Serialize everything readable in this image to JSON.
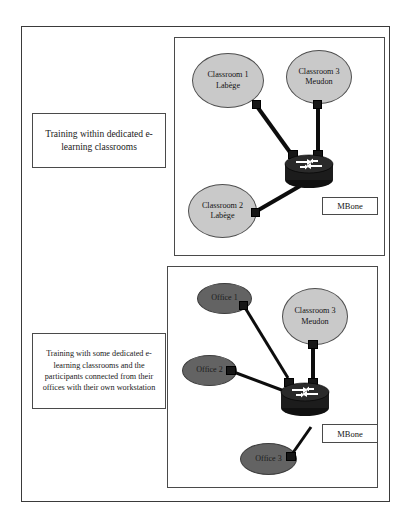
{
  "figure": {
    "panels": [
      {
        "id": "dedicated-classrooms",
        "caption": "Training within dedicated e-learning classrooms",
        "nodes": [
          {
            "name": "classroom-1",
            "type": "classroom",
            "line1": "Classroom 1",
            "line2": "Labège"
          },
          {
            "name": "classroom-3",
            "type": "classroom",
            "line1": "Classroom 3",
            "line2": "Meudon"
          },
          {
            "name": "classroom-2",
            "type": "classroom",
            "line1": "Classroom 2",
            "line2": "Labège"
          }
        ],
        "router_label": "MBone"
      },
      {
        "id": "mixed-classrooms-offices",
        "caption": "Training with some dedicated e-learning classrooms and the participants connected from their offices with their own workstation",
        "nodes": [
          {
            "name": "office-1",
            "type": "office",
            "line1": "Office 1",
            "line2": ""
          },
          {
            "name": "classroom-3",
            "type": "classroom",
            "line1": "Classroom 3",
            "line2": "Meudon"
          },
          {
            "name": "office-2",
            "type": "office",
            "line1": "Office 2",
            "line2": ""
          },
          {
            "name": "office-3",
            "type": "office",
            "line1": "Office 3",
            "line2": ""
          }
        ],
        "router_label": "MBone"
      }
    ],
    "colors": {
      "classroom_fill": "#c9c9c9",
      "office_fill": "#636363",
      "router_body": "#1c1c1c",
      "link": "#0d0d0d",
      "border": "#4a4a4a",
      "background": "#ffffff"
    },
    "icons": {
      "router": "router-icon",
      "connector": "connector-square-icon"
    }
  }
}
